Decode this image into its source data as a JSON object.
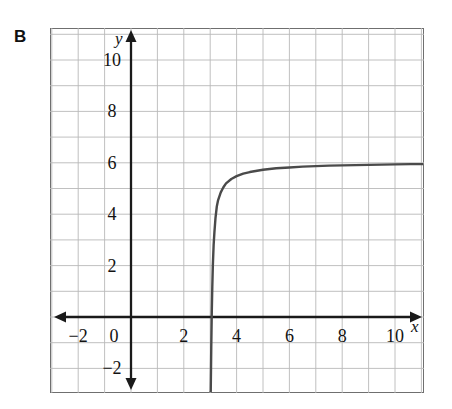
{
  "figure": {
    "panel_label": "B",
    "background_color": "#ffffff",
    "frame_color": "#6f6f6f",
    "grid_color": "#b9b9b9",
    "axis_color": "#1a1a1a",
    "curve_color": "#4a4a4a"
  },
  "axes": {
    "x_name": "x",
    "y_name": "y",
    "x_ticks": [
      {
        "value": -2,
        "label": "−2"
      },
      {
        "value": 0,
        "label": "0"
      },
      {
        "value": 2,
        "label": "2"
      },
      {
        "value": 4,
        "label": "4"
      },
      {
        "value": 6,
        "label": "6"
      },
      {
        "value": 8,
        "label": "8"
      },
      {
        "value": 10,
        "label": "10"
      }
    ],
    "y_ticks": [
      {
        "value": 10,
        "label": "10"
      },
      {
        "value": 8,
        "label": "8"
      },
      {
        "value": 6,
        "label": "6"
      },
      {
        "value": 4,
        "label": "4"
      },
      {
        "value": 2,
        "label": "2"
      },
      {
        "value": -2,
        "label": "−2"
      }
    ]
  },
  "chart_data": {
    "type": "line",
    "title": "B",
    "xlabel": "x",
    "ylabel": "y",
    "xlim": [
      -3.1,
      11.1
    ],
    "ylim": [
      -2.9,
      11.4
    ],
    "grid": true,
    "grid_step": 1,
    "legend": "none",
    "annotations": [
      {
        "text": "vertical asymptote at x = 3",
        "x": 3,
        "y": 0
      },
      {
        "text": "horizontal asymptote at y = 6",
        "x": 11,
        "y": 6
      }
    ],
    "series": [
      {
        "name": "curve",
        "description": "increasing logarithmic-type curve, vertical asymptote x = 3, approaches y = 6",
        "x": [
          3.02,
          3.04,
          3.06,
          3.08,
          3.1,
          3.13,
          3.16,
          3.2,
          3.25,
          3.3,
          3.4,
          3.5,
          3.6,
          3.8,
          4.0,
          4.25,
          4.5,
          5.0,
          5.5,
          6.0,
          6.5,
          7.0,
          7.5,
          8.0,
          8.5,
          9.0,
          9.5,
          10.0,
          10.6,
          11.1
        ],
        "y": [
          -2.9,
          -1.2,
          0.2,
          1.2,
          2.0,
          2.8,
          3.3,
          3.85,
          4.3,
          4.55,
          4.85,
          5.05,
          5.2,
          5.37,
          5.48,
          5.58,
          5.64,
          5.73,
          5.79,
          5.82,
          5.85,
          5.87,
          5.89,
          5.9,
          5.91,
          5.92,
          5.93,
          5.94,
          5.95,
          5.95
        ]
      }
    ]
  }
}
